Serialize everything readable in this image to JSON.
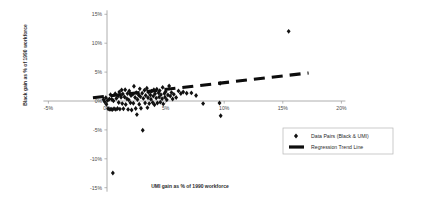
{
  "chart_data": {
    "type": "scatter",
    "title": "",
    "xlabel": "UMI gain as % of 1990 workforce",
    "ylabel": "Black gain as % of 1990 workforce",
    "xlim": [
      -5,
      20
    ],
    "ylim": [
      -15,
      15
    ],
    "xticks": [
      -5,
      0,
      5,
      10,
      15,
      20
    ],
    "xtick_labels": [
      "-5%",
      "0%",
      "5%",
      "10%",
      "15%",
      "20%"
    ],
    "yticks": [
      -15,
      -10,
      -5,
      0,
      5,
      10,
      15
    ],
    "ytick_labels": [
      "-15%",
      "-10%",
      "-5%",
      "0%",
      "5%",
      "10%",
      "15%"
    ],
    "grid": false,
    "legend_position": "bottom-right",
    "series": [
      {
        "name": "Data Pairs (Black & UMI)",
        "marker": "diamond",
        "color": "#111111",
        "points": [
          [
            -0.3,
            0.25
          ],
          [
            -0.2,
            -0.15
          ],
          [
            -0.1,
            0.55
          ],
          [
            -0.05,
            -0.55
          ],
          [
            0.05,
            0.1
          ],
          [
            0.1,
            -1.35
          ],
          [
            0.2,
            0.35
          ],
          [
            0.25,
            -1.45
          ],
          [
            0.3,
            1.1
          ],
          [
            0.35,
            -1.4
          ],
          [
            0.4,
            0.3
          ],
          [
            0.45,
            -1.5
          ],
          [
            0.5,
            -12.45
          ],
          [
            0.55,
            0.05
          ],
          [
            0.6,
            -1.35
          ],
          [
            0.7,
            1.25
          ],
          [
            0.75,
            -1.45
          ],
          [
            0.8,
            0.45
          ],
          [
            0.9,
            -1.3
          ],
          [
            0.95,
            0.85
          ],
          [
            1.0,
            -0.25
          ],
          [
            1.05,
            1.55
          ],
          [
            1.1,
            -1.4
          ],
          [
            1.2,
            0.65
          ],
          [
            1.25,
            1.9
          ],
          [
            1.3,
            -0.45
          ],
          [
            1.35,
            1.2
          ],
          [
            1.4,
            -1.35
          ],
          [
            1.5,
            0.7
          ],
          [
            1.55,
            1.95
          ],
          [
            1.6,
            -0.6
          ],
          [
            1.7,
            0.4
          ],
          [
            1.75,
            1.3
          ],
          [
            1.8,
            -1.45
          ],
          [
            1.85,
            0.2
          ],
          [
            1.9,
            1.75
          ],
          [
            2.0,
            -0.3
          ],
          [
            2.05,
            0.95
          ],
          [
            2.1,
            -1.55
          ],
          [
            2.2,
            1.15
          ],
          [
            2.25,
            -0.4
          ],
          [
            2.3,
            2.55
          ],
          [
            2.4,
            0.6
          ],
          [
            2.45,
            -1.3
          ],
          [
            2.5,
            1.45
          ],
          [
            2.55,
            -2.35
          ],
          [
            2.6,
            0.25
          ],
          [
            2.7,
            1.05
          ],
          [
            2.75,
            -0.55
          ],
          [
            2.8,
            2.1
          ],
          [
            2.85,
            0.75
          ],
          [
            2.9,
            -1.25
          ],
          [
            3.0,
            1.35
          ],
          [
            3.05,
            -5.05
          ],
          [
            3.1,
            0.45
          ],
          [
            3.2,
            1.85
          ],
          [
            3.25,
            -0.35
          ],
          [
            3.3,
            0.95
          ],
          [
            3.4,
            2.2
          ],
          [
            3.45,
            -1.15
          ],
          [
            3.5,
            0.55
          ],
          [
            3.55,
            1.5
          ],
          [
            3.6,
            -0.45
          ],
          [
            3.7,
            1.05
          ],
          [
            3.75,
            0.3
          ],
          [
            3.8,
            1.7
          ],
          [
            3.9,
            -0.25
          ],
          [
            3.95,
            0.85
          ],
          [
            4.0,
            1.95
          ],
          [
            4.05,
            -0.65
          ],
          [
            4.1,
            1.25
          ],
          [
            4.2,
            0.5
          ],
          [
            4.25,
            2.05
          ],
          [
            4.3,
            -0.35
          ],
          [
            4.4,
            1.4
          ],
          [
            4.45,
            0.7
          ],
          [
            4.5,
            1.8
          ],
          [
            4.55,
            -0.2
          ],
          [
            4.6,
            1.1
          ],
          [
            4.7,
            0.4
          ],
          [
            4.75,
            2.35
          ],
          [
            4.8,
            -0.5
          ],
          [
            4.9,
            1.3
          ],
          [
            4.95,
            0.65
          ],
          [
            5.0,
            1.6
          ],
          [
            5.1,
            0.2
          ],
          [
            5.2,
            1.05
          ],
          [
            5.3,
            2.6
          ],
          [
            5.4,
            0.85
          ],
          [
            5.5,
            1.45
          ],
          [
            5.6,
            0.35
          ],
          [
            5.7,
            1.15
          ],
          [
            5.9,
            0.6
          ],
          [
            6.1,
            1.75
          ],
          [
            6.3,
            1.3
          ],
          [
            6.5,
            1.55
          ],
          [
            6.8,
            1.35
          ],
          [
            7.2,
            1.4
          ],
          [
            7.6,
            0.95
          ],
          [
            8.2,
            -0.45
          ],
          [
            9.6,
            -0.35
          ],
          [
            9.7,
            -2.55
          ],
          [
            9.65,
            3.05
          ],
          [
            15.5,
            12.05
          ]
        ]
      }
    ],
    "trend_line": {
      "name": "Regression Trend Line",
      "style": "dashed",
      "color": "#0d0d0d",
      "x_start": -1.2,
      "y_start": 0.55,
      "x_end": 17.2,
      "y_end": 4.85
    }
  },
  "legend": {
    "entries": [
      {
        "label": "Data Pairs (Black & UMI)",
        "symbol": "diamond"
      },
      {
        "label": "Regression Trend Line",
        "symbol": "dash"
      }
    ]
  },
  "axes": {
    "x_title": "UMI gain as % of 1990 workforce",
    "y_title": "Black gain as % of 1990 workforce"
  },
  "colors": {
    "marker": "#111111",
    "trend": "#0d0d0d",
    "axis": "#9a9a9a",
    "background": "#ffffff"
  }
}
